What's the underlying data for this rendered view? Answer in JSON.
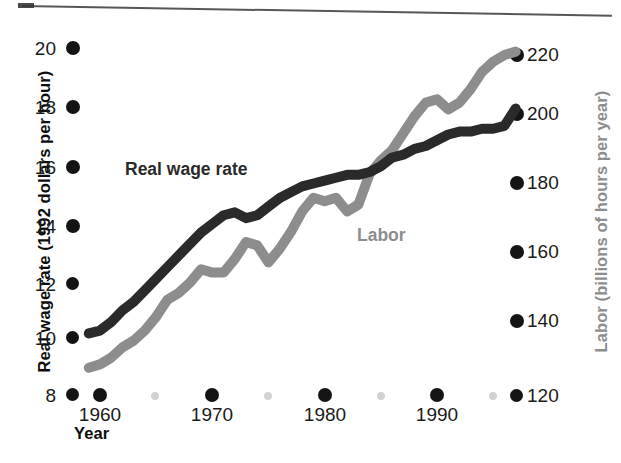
{
  "figure": {
    "background": "#ffffff",
    "width": 621,
    "height": 463
  },
  "axes": {
    "left": {
      "title": "Real wage rate (1992 dollars per hour)",
      "color": "#0d0d0d",
      "ticks": [
        "20",
        "18",
        "16",
        "14",
        "12",
        "10",
        "8"
      ]
    },
    "right": {
      "title": "Labor (billions of hours per year)",
      "color": "#8d8d8d",
      "ticks": [
        "220",
        "200",
        "180",
        "160",
        "140",
        "120"
      ]
    },
    "bottom": {
      "title": "Year",
      "color": "#0d0d0d",
      "ticks": [
        "1960",
        "1970",
        "1980",
        "1990"
      ]
    }
  },
  "series_labels": {
    "wage": "Real wage rate",
    "labor": "Labor"
  },
  "colors": {
    "wage_line": "#2a2a2a",
    "labor_line": "#8d8d8d",
    "tick_dot": "#141414",
    "minor_dot": "#d2d2d2"
  },
  "chart_data": {
    "type": "line",
    "title": "",
    "subtitle": "",
    "xlabel": "Year",
    "ylabel": "Real wage rate (1992 dollars per hour)",
    "y2label": "Labor (billions of hours per year)",
    "xlim": [
      1959,
      1997
    ],
    "ylim": [
      8,
      20
    ],
    "y2lim": [
      112,
      228
    ],
    "xticks": [
      1960,
      1970,
      1980,
      1990
    ],
    "yticks": [
      8,
      10,
      12,
      14,
      16,
      18,
      20
    ],
    "y2ticks": [
      120,
      140,
      160,
      180,
      200,
      220
    ],
    "grid": false,
    "legend": "inline-annotations",
    "x": [
      1959,
      1960,
      1961,
      1962,
      1963,
      1964,
      1965,
      1966,
      1967,
      1968,
      1969,
      1970,
      1971,
      1972,
      1973,
      1974,
      1975,
      1976,
      1977,
      1978,
      1979,
      1980,
      1981,
      1982,
      1983,
      1984,
      1985,
      1986,
      1987,
      1988,
      1989,
      1990,
      1991,
      1992,
      1993,
      1994,
      1995,
      1996,
      1997
    ],
    "series": [
      {
        "name": "Real wage rate",
        "axis": "left",
        "units": "1992 dollars per hour",
        "color": "#2a2a2a",
        "values": [
          10.1,
          10.2,
          10.5,
          10.9,
          11.2,
          11.6,
          12.0,
          12.4,
          12.8,
          13.2,
          13.6,
          13.9,
          14.2,
          14.3,
          14.1,
          14.2,
          14.5,
          14.8,
          15.0,
          15.2,
          15.3,
          15.4,
          15.5,
          15.6,
          15.6,
          15.7,
          15.9,
          16.2,
          16.3,
          16.5,
          16.6,
          16.8,
          17.0,
          17.1,
          17.1,
          17.2,
          17.2,
          17.3,
          17.9
        ]
      },
      {
        "name": "Labor",
        "axis": "right",
        "units": "billions of hours per year",
        "color": "#8d8d8d",
        "values": [
          128,
          129,
          131,
          134,
          136,
          139,
          143,
          148,
          150,
          153,
          157,
          156,
          156,
          160,
          165,
          164,
          159,
          163,
          168,
          174,
          178,
          177,
          178,
          174,
          176,
          185,
          189,
          192,
          197,
          202,
          206,
          207,
          204,
          206,
          210,
          215,
          218,
          220,
          221
        ]
      }
    ]
  }
}
